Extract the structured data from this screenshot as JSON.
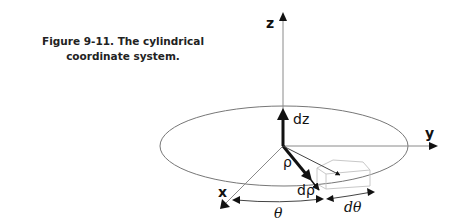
{
  "figure": {
    "caption_line1": "Figure 9-11. The cylindrical",
    "caption_line2": "coordinate system."
  },
  "diagram": {
    "axes": {
      "z_label": "z",
      "y_label": "y",
      "x_label": "x"
    },
    "labels": {
      "dz": "dz",
      "rho": "ρ",
      "d_rho": "dρ",
      "theta": "θ",
      "d_theta": "dθ"
    },
    "colors": {
      "axis_line": "#8a8a8a",
      "arrow": "#111111",
      "ellipse": "#777777",
      "volume_box": "#c8c8c8"
    }
  }
}
